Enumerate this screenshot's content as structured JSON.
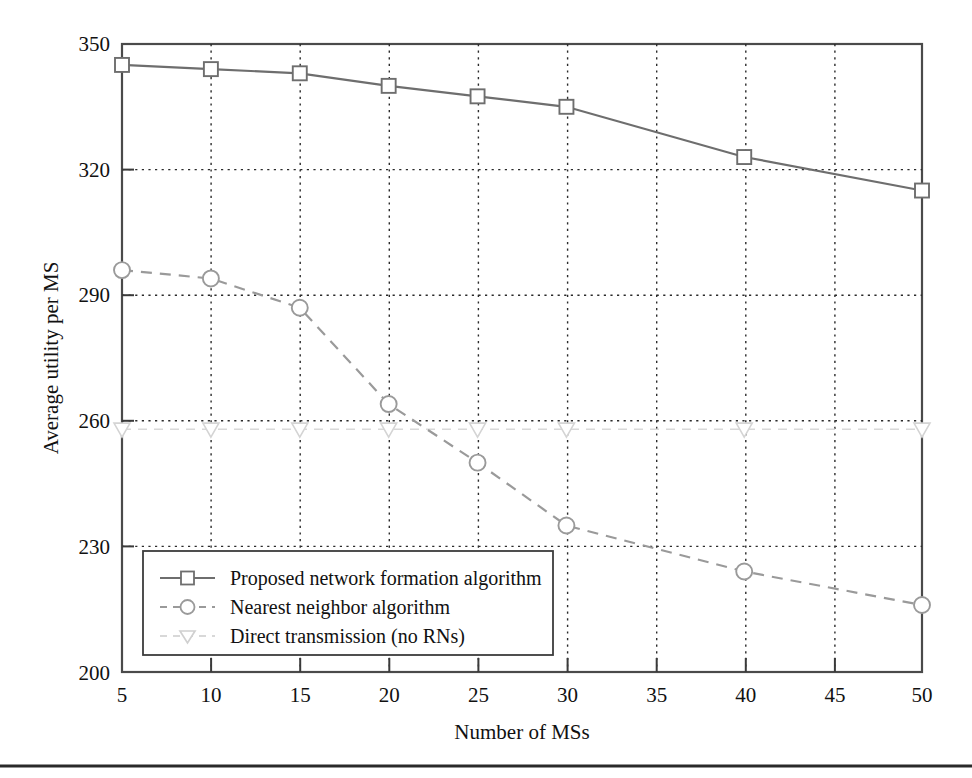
{
  "chart_data": {
    "type": "line",
    "title": "",
    "xlabel": "Number of MSs",
    "ylabel": "Average utility per MS",
    "x": [
      5,
      10,
      15,
      20,
      25,
      30,
      35,
      40,
      45,
      50
    ],
    "categories": [
      "5",
      "10",
      "15",
      "20",
      "25",
      "30",
      "35",
      "40",
      "45",
      "50"
    ],
    "xlim": [
      5,
      50
    ],
    "ylim": [
      200,
      350
    ],
    "xticks": [
      5,
      10,
      15,
      20,
      25,
      30,
      35,
      40,
      45,
      50
    ],
    "yticks": [
      200,
      230,
      260,
      290,
      320,
      350
    ],
    "grid": true,
    "legend_position": "lower-left-inside",
    "series": [
      {
        "name": "Proposed network formation algorithm",
        "marker": "square",
        "linestyle": "solid",
        "color": "#6e6e6e",
        "x": [
          5,
          10,
          15,
          20,
          25,
          30,
          40,
          50
        ],
        "values": [
          345,
          344,
          343,
          340,
          337.5,
          335,
          323,
          315
        ]
      },
      {
        "name": "Nearest neighbor algorithm",
        "marker": "circle",
        "linestyle": "dashed",
        "color": "#8c8c8c",
        "x": [
          5,
          10,
          15,
          20,
          25,
          30,
          40,
          50
        ],
        "values": [
          296,
          294,
          287,
          264,
          250,
          235,
          224,
          216
        ]
      },
      {
        "name": "Direct transmission (no RNs)",
        "marker": "triangle-down",
        "linestyle": "dashed",
        "color": "#d8d8d8",
        "x": [
          5,
          10,
          15,
          20,
          25,
          30,
          40,
          50
        ],
        "values": [
          258,
          258,
          258,
          258,
          258,
          258,
          258,
          258
        ]
      }
    ]
  },
  "axes": {
    "y_tick_labels": [
      "350",
      "320",
      "290",
      "260",
      "230",
      "200"
    ],
    "x_tick_labels": [
      "5",
      "10",
      "15",
      "20",
      "25",
      "30",
      "35",
      "40",
      "45",
      "50"
    ],
    "x_axis_title": "Number of MSs",
    "y_axis_title": "Average utility per MS"
  },
  "legend": {
    "entries": [
      {
        "label": "Proposed network formation algorithm",
        "marker": "square-marker",
        "style": "solid"
      },
      {
        "label": "Nearest neighbor algorithm",
        "marker": "circle-marker",
        "style": "dashed"
      },
      {
        "label": "Direct transmission (no RNs)",
        "marker": "triangle-down-marker",
        "style": "dashed-faint"
      }
    ]
  },
  "colors": {
    "series_proposed": "#6e6e6e",
    "series_nearest": "#8c8c8c",
    "series_direct": "#d8d8d8",
    "frame": "#4a4a4a",
    "grid": "#2b2b2b",
    "text": "#111111"
  }
}
